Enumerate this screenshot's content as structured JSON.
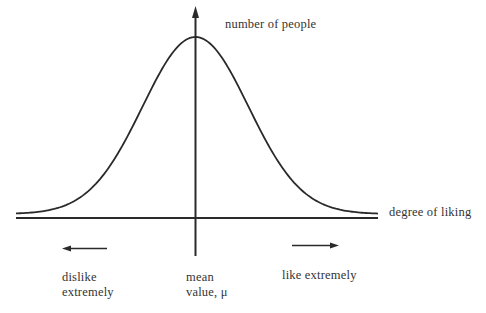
{
  "figure": {
    "title": "",
    "axes": {
      "y_label": "number of people",
      "x_label": "degree of liking"
    },
    "annotations": {
      "left": [
        "dislike",
        "extremely"
      ],
      "center": [
        "mean",
        "value, μ"
      ],
      "right": "like extremely"
    },
    "curve": {
      "type": "normal distribution (bell curve)",
      "mean_label": "μ"
    },
    "colors": {
      "ink": "#2a2a2a",
      "background": "#ffffff"
    }
  }
}
